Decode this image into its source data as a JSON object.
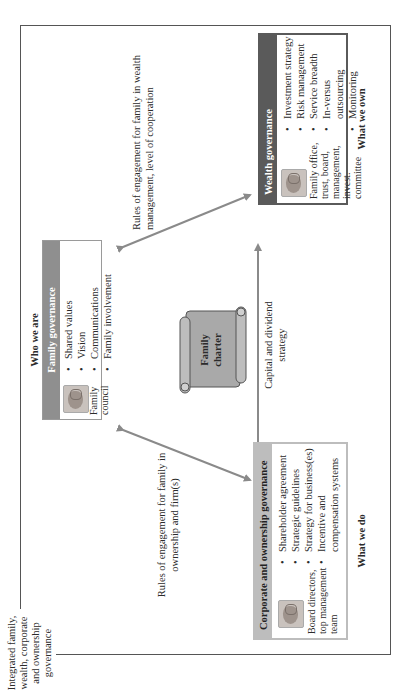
{
  "frame_label": "Integrated family, wealth, corporate and ownership governance",
  "family": {
    "caption_top": "Who we are",
    "title": "Family governance",
    "bodies": "Family council",
    "items": [
      "Shared values",
      "Vision",
      "Communications",
      "Family involvement"
    ]
  },
  "wealth": {
    "title": "Wealth governance",
    "bodies": "Family office, trust, board, management, invest. committee",
    "items": [
      "Investment strategy",
      "Risk management",
      "Service breadth",
      "In-versus outsourcing",
      "Monitoring"
    ],
    "caption_bottom": "What we own"
  },
  "corporate": {
    "title": "Corporate and ownership governance",
    "bodies": "Board directors, top management team",
    "items": [
      "Shareholder agreement",
      "Strategic guidelines",
      "Strategy for business(es)",
      "Incentive and compensation systems"
    ],
    "caption_bottom": "What we do"
  },
  "charter": {
    "label": "Family charter"
  },
  "arrows": {
    "to_wealth_label": "Rules of engagement for family in wealth management, level of cooperation",
    "to_corporate_label": "Rules of engagement for family in ownership and firm(s)",
    "between_label": "Capital and dividend strategy"
  },
  "colors": {
    "dark_header": "#5a5a5a",
    "light_header": "#bdbdbd",
    "arrow": "#8a8a8a",
    "frame": "#555555"
  }
}
